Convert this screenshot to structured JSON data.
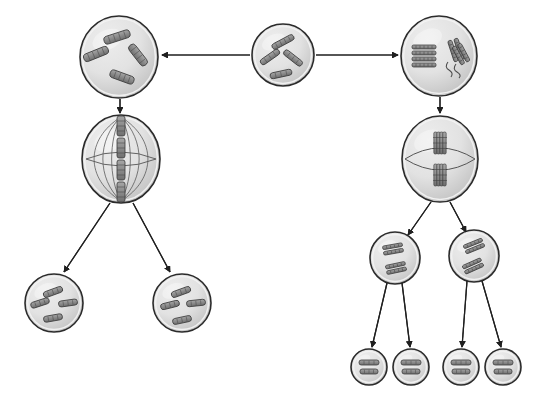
{
  "diagram": {
    "type": "biology-process-diagram",
    "canvas": {
      "width": 545,
      "height": 400,
      "background": "#ffffff"
    },
    "style": {
      "cell_fill_light": "#e2e2e2",
      "cell_fill_mid": "#d2d2d2",
      "cell_fill_dark": "#c2c2c2",
      "cell_stroke": "#2b2b2b",
      "membrane_inner_stroke": "#f2f2f2",
      "chromosome_fill": "#8a8a8a",
      "chromosome_stroke": "#3a3a3a",
      "spindle_stroke": "#555555",
      "arrow_stroke": "#1f1f1f",
      "arrow_width": 1.2
    },
    "cells": [
      {
        "id": "parent-cell",
        "name": "parent-cell",
        "role": "parent diploid cell",
        "cx": 283,
        "cy": 55,
        "rx": 31,
        "ry": 31,
        "shape": "circle",
        "chromosome_count": 4,
        "chromosomes": [
          {
            "x": 283,
            "y": 42,
            "len": 24,
            "w": 6,
            "angle": -28
          },
          {
            "x": 270,
            "y": 57,
            "len": 22,
            "w": 6,
            "angle": -35
          },
          {
            "x": 293,
            "y": 58,
            "len": 22,
            "w": 6,
            "angle": 38
          },
          {
            "x": 281,
            "y": 74,
            "len": 22,
            "w": 6,
            "angle": -12
          }
        ]
      },
      {
        "id": "mitosis-prophase-cell",
        "name": "mitosis-prophase-cell",
        "role": "mitosis prophase cell",
        "cx": 119,
        "cy": 57,
        "rx": 39,
        "ry": 41,
        "shape": "circle",
        "chromosome_count": 4,
        "chromosomes": [
          {
            "x": 117,
            "y": 37,
            "len": 27,
            "w": 8,
            "angle": -18
          },
          {
            "x": 96,
            "y": 54,
            "len": 26,
            "w": 8,
            "angle": -22
          },
          {
            "x": 138,
            "y": 55,
            "len": 25,
            "w": 8,
            "angle": 52
          },
          {
            "x": 122,
            "y": 77,
            "len": 25,
            "w": 8,
            "angle": 20
          }
        ]
      },
      {
        "id": "meiosis-prophase-cell",
        "name": "meiosis-prophase-cell",
        "role": "meiosis prophase I cell with paired homologues",
        "cx": 439,
        "cy": 56,
        "rx": 38,
        "ry": 40,
        "shape": "circle",
        "chromosome_count": 4,
        "pairs": [
          {
            "x": 424,
            "y": 55,
            "orientation": "horizontal"
          },
          {
            "x": 455,
            "y": 54,
            "orientation": "tilted"
          }
        ]
      },
      {
        "id": "mitosis-metaphase-cell",
        "name": "mitosis-metaphase-cell",
        "role": "mitosis metaphase cell with spindle",
        "cx": 121,
        "cy": 159,
        "rx": 39,
        "ry": 44,
        "shape": "ellipse",
        "spindle_arcs": 3,
        "chromosome_count": 4,
        "plate": "vertical-center"
      },
      {
        "id": "meiosis-metaphase-cell",
        "name": "meiosis-metaphase-cell",
        "role": "meiosis metaphase I cell with tetrads",
        "cx": 440,
        "cy": 159,
        "rx": 38,
        "ry": 43,
        "shape": "ellipse",
        "spindle_arcs": 2,
        "chromosome_count": 4,
        "plate": "two-tetrads-center"
      },
      {
        "id": "mitosis-daughter-cell-left",
        "name": "mitosis-daughter-cell-left",
        "role": "mitosis daughter cell (diploid)",
        "cx": 54,
        "cy": 303,
        "rx": 29,
        "ry": 29,
        "shape": "circle",
        "chromosome_count": 4,
        "chromosomes": [
          {
            "x": 53,
            "y": 292,
            "len": 20,
            "w": 6,
            "angle": -20
          },
          {
            "x": 40,
            "y": 303,
            "len": 19,
            "w": 6,
            "angle": -18
          },
          {
            "x": 68,
            "y": 303,
            "len": 19,
            "w": 6,
            "angle": -8
          },
          {
            "x": 53,
            "y": 318,
            "len": 19,
            "w": 6,
            "angle": -10
          }
        ]
      },
      {
        "id": "mitosis-daughter-cell-right",
        "name": "mitosis-daughter-cell-right",
        "role": "mitosis daughter cell (diploid)",
        "cx": 182,
        "cy": 303,
        "rx": 29,
        "ry": 29,
        "shape": "circle",
        "chromosome_count": 4,
        "chromosomes": [
          {
            "x": 181,
            "y": 292,
            "len": 20,
            "w": 6,
            "angle": -20
          },
          {
            "x": 170,
            "y": 305,
            "len": 19,
            "w": 6,
            "angle": -14
          },
          {
            "x": 196,
            "y": 303,
            "len": 19,
            "w": 6,
            "angle": -6
          },
          {
            "x": 182,
            "y": 320,
            "len": 19,
            "w": 6,
            "angle": -12
          }
        ]
      },
      {
        "id": "meiosis-secondary-cell-left",
        "name": "meiosis-secondary-cell-left",
        "role": "secondary cell after meiosis I",
        "cx": 395,
        "cy": 258,
        "rx": 25,
        "ry": 26,
        "shape": "circle",
        "chromosome_count": 2,
        "chromosomes": [
          {
            "x": 393,
            "y": 249,
            "len": 20,
            "w": 7,
            "angle": -10
          },
          {
            "x": 396,
            "y": 268,
            "len": 20,
            "w": 7,
            "angle": -12
          }
        ]
      },
      {
        "id": "meiosis-secondary-cell-right",
        "name": "meiosis-secondary-cell-right",
        "role": "secondary cell after meiosis I",
        "cx": 474,
        "cy": 256,
        "rx": 25,
        "ry": 26,
        "shape": "circle",
        "chromosome_count": 2,
        "chromosomes": [
          {
            "x": 474,
            "y": 246,
            "len": 20,
            "w": 7,
            "angle": -22
          },
          {
            "x": 473,
            "y": 266,
            "len": 20,
            "w": 7,
            "angle": -24
          }
        ]
      },
      {
        "id": "gamete-cell-1",
        "name": "gamete-cell-1",
        "role": "haploid gamete",
        "cx": 369,
        "cy": 367,
        "rx": 18,
        "ry": 18,
        "shape": "circle",
        "chromosome_count": 2
      },
      {
        "id": "gamete-cell-2",
        "name": "gamete-cell-2",
        "role": "haploid gamete",
        "cx": 411,
        "cy": 367,
        "rx": 18,
        "ry": 18,
        "shape": "circle",
        "chromosome_count": 2
      },
      {
        "id": "gamete-cell-3",
        "name": "gamete-cell-3",
        "role": "haploid gamete",
        "cx": 461,
        "cy": 367,
        "rx": 18,
        "ry": 18,
        "shape": "circle",
        "chromosome_count": 2
      },
      {
        "id": "gamete-cell-4",
        "name": "gamete-cell-4",
        "role": "haploid gamete",
        "cx": 503,
        "cy": 367,
        "rx": 18,
        "ry": 18,
        "shape": "circle",
        "chromosome_count": 2
      }
    ],
    "arrows": [
      {
        "id": "arrow-parent-to-mitosis",
        "name": "arrow-parent-to-mitosis",
        "x1": 250,
        "y1": 55,
        "x2": 162,
        "y2": 55,
        "direction": "left"
      },
      {
        "id": "arrow-parent-to-meiosis",
        "name": "arrow-parent-to-meiosis",
        "x1": 316,
        "y1": 55,
        "x2": 398,
        "y2": 55,
        "direction": "right"
      },
      {
        "id": "arrow-mitosis-prophase-to-metaphase",
        "name": "arrow-mitosis-prophase-to-metaphase",
        "x1": 120,
        "y1": 99,
        "x2": 120,
        "y2": 113,
        "direction": "down"
      },
      {
        "id": "arrow-meiosis-prophase-to-metaphase",
        "name": "arrow-meiosis-prophase-to-metaphase",
        "x1": 440,
        "y1": 97,
        "x2": 440,
        "y2": 113,
        "direction": "down"
      },
      {
        "id": "arrow-mitosis-to-daughter-left",
        "name": "arrow-mitosis-to-daughter-left",
        "x1": 110,
        "y1": 203,
        "x2": 64,
        "y2": 272,
        "direction": "down-left"
      },
      {
        "id": "arrow-mitosis-to-daughter-right",
        "name": "arrow-mitosis-to-daughter-right",
        "x1": 133,
        "y1": 203,
        "x2": 170,
        "y2": 272,
        "direction": "down-right"
      },
      {
        "id": "arrow-meiosis-to-secondary-left",
        "name": "arrow-meiosis-to-secondary-left",
        "x1": 431,
        "y1": 202,
        "x2": 408,
        "y2": 235,
        "direction": "down-left"
      },
      {
        "id": "arrow-meiosis-to-secondary-right",
        "name": "arrow-meiosis-to-secondary-right",
        "x1": 450,
        "y1": 202,
        "x2": 466,
        "y2": 232,
        "direction": "down-right"
      },
      {
        "id": "arrow-secondary-left-to-gamete-1",
        "name": "arrow-secondary-left-to-gamete-1",
        "x1": 387,
        "y1": 283,
        "x2": 372,
        "y2": 347,
        "direction": "down-left"
      },
      {
        "id": "arrow-secondary-left-to-gamete-2",
        "name": "arrow-secondary-left-to-gamete-2",
        "x1": 402,
        "y1": 283,
        "x2": 410,
        "y2": 347,
        "direction": "down-right"
      },
      {
        "id": "arrow-secondary-right-to-gamete-3",
        "name": "arrow-secondary-right-to-gamete-3",
        "x1": 467,
        "y1": 281,
        "x2": 462,
        "y2": 347,
        "direction": "down-left"
      },
      {
        "id": "arrow-secondary-right-to-gamete-4",
        "name": "arrow-secondary-right-to-gamete-4",
        "x1": 482,
        "y1": 281,
        "x2": 501,
        "y2": 347,
        "direction": "down-right"
      }
    ]
  }
}
